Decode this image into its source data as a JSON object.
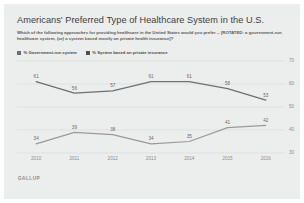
{
  "chart_data": {
    "type": "line",
    "title": "Americans' Preferred Type of Healthcare System in the U.S.",
    "subtitle": "Which of the following approaches for providing healthcare in the United States would you prefer -- [ROTATED: a government-run healthcare system, (or) a system based mostly on private health insurance]?",
    "source": "GALLUP",
    "categories": [
      "2010",
      "2011",
      "2012",
      "2013",
      "2014",
      "2015",
      "2016"
    ],
    "x": [
      2010,
      2011,
      2012,
      2013,
      2014,
      2015,
      2016
    ],
    "xlabel": "",
    "ylabel": "",
    "ylim": [
      30,
      70
    ],
    "yticks": [
      30,
      40,
      50,
      60,
      70
    ],
    "grid": true,
    "legend_position": "top-left",
    "series": [
      {
        "name": "% Government-run system",
        "color": "#6f6f6f",
        "values": [
          61,
          56,
          57,
          61,
          61,
          58,
          53
        ]
      },
      {
        "name": "% System based on private insurance",
        "color": "#9a9a9a",
        "values": [
          34,
          39,
          38,
          34,
          35,
          41,
          42
        ]
      }
    ]
  },
  "colors": {
    "card_background": "#eceded",
    "title": "#3c3c3c",
    "subtitle": "#5a5a5a",
    "gridline": "#d9dada",
    "axis_label": "#8d8d8d",
    "series_primary": "#6f6f6f",
    "series_secondary": "#9a9a9a"
  }
}
